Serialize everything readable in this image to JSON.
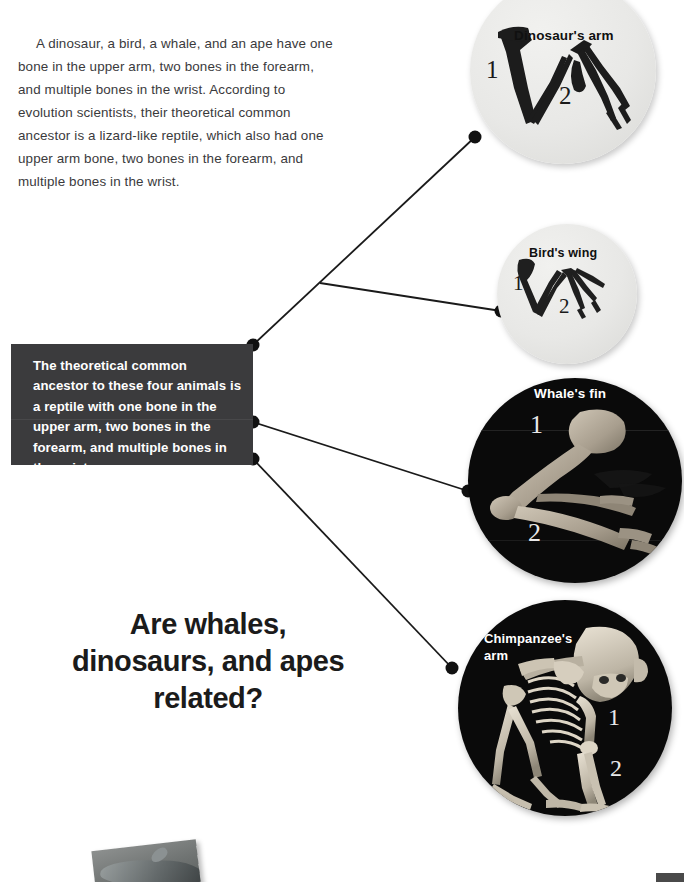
{
  "page": {
    "background_color": "#ffffff",
    "width": 684,
    "height": 882
  },
  "intro": {
    "text": "A dinosaur, a bird, a whale, and an ape have one bone in the upper arm, two bones in the forearm, and multiple bones in the wrist.  According to evolution scientists, their theoretical common ancestor is a lizard-like reptile, which also had one upper arm bone, two bones in the forearm, and multiple bones in the wrist.",
    "color": "#3a3a3c"
  },
  "ancestor_box": {
    "text": "The theoretical common ancestor to these four animals is a reptile with one bone in the upper arm, two bones in the forearm, and multiple bones in the wrist.",
    "background_color": "#3b3b3d",
    "text_color": "#ffffff"
  },
  "headline": {
    "text": "Are whales, dinosaurs, and apes related?",
    "color": "#1b1b1b"
  },
  "specimens": [
    {
      "id": "dinosaur",
      "caption": "Dinosaur's arm",
      "bone_labels": {
        "upper_arm": "1",
        "forearm": "2"
      },
      "style": "light"
    },
    {
      "id": "bird",
      "caption": "Bird's wing",
      "bone_labels": {
        "upper_arm": "1",
        "forearm": "2"
      },
      "style": "light"
    },
    {
      "id": "whale",
      "caption": "Whale's fin",
      "bone_labels": {
        "upper_arm": "1",
        "forearm": "2"
      },
      "style": "dark"
    },
    {
      "id": "chimpanzee",
      "caption": "Chimpanzee's arm",
      "bone_labels": {
        "upper_arm": "1",
        "forearm": "2"
      },
      "style": "dark"
    }
  ],
  "connectors": {
    "line_color": "#1a1a1a",
    "node_color": "#111111"
  }
}
